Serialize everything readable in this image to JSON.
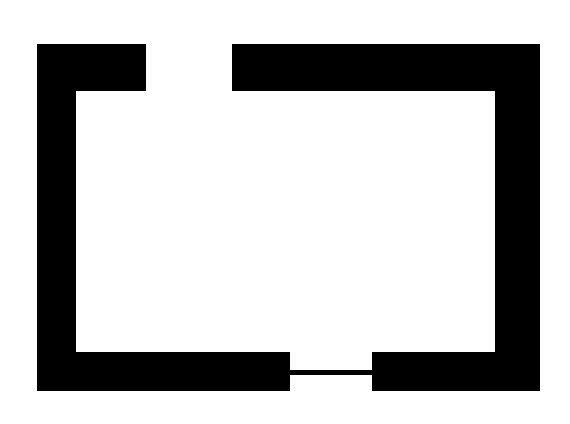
{
  "figure": {
    "canvas": {
      "width": 570,
      "height": 424,
      "background_color": "#ffffff"
    },
    "stroke_color": "#000000",
    "fill_color": "#000000",
    "geometry": {
      "outer_rect": {
        "left": 37,
        "top": 44,
        "right": 540,
        "bottom": 391
      },
      "inner_rect": {
        "left": 76,
        "top": 91,
        "right": 495,
        "bottom": 352
      },
      "band_thickness": {
        "left": 39,
        "right": 45,
        "top": 47,
        "bottom": 39
      },
      "top_gap": {
        "x_start": 146,
        "x_end": 232,
        "width": 86
      },
      "bottom_gap": {
        "x_start": 290,
        "x_end": 372,
        "width": 82
      },
      "bridge_line": {
        "x_start": 290,
        "x_end": 372,
        "y_top": 370,
        "y_bottom": 375,
        "thickness": 5
      }
    },
    "shape_path": "M 37 44 L 146 44 L 146 91 L 76 91 L 76 352 L 290 352 L 290 370 L 372 370 L 372 352 L 495 352 L 495 91 L 232 91 L 232 44 L 540 44 L 540 391 L 372 391 L 372 375 L 290 375 L 290 391 L 37 391 Z",
    "caption": ""
  }
}
